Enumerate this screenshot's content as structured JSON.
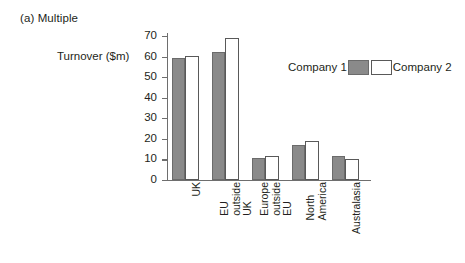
{
  "chart_data": {
    "type": "bar",
    "title": "(a) Multiple",
    "xlabel": "",
    "ylabel": "Turnover ($m)",
    "ylim": [
      0,
      70
    ],
    "yticks": [
      0,
      10,
      20,
      30,
      40,
      50,
      60,
      70
    ],
    "grid": false,
    "legend_position": "inside-upper-right",
    "categories": [
      "UK",
      "EU outside UK",
      "Europe outside EU",
      "North America",
      "Australasia"
    ],
    "category_lines": [
      [
        "UK"
      ],
      [
        "EU",
        "outside",
        "UK"
      ],
      [
        "Europe",
        "outside",
        "EU"
      ],
      [
        "North",
        "America"
      ],
      [
        "Australasia"
      ]
    ],
    "series": [
      {
        "name": "Company 1",
        "color": "#8a8a8a",
        "values": [
          59.5,
          62,
          10.5,
          17,
          11.5
        ]
      },
      {
        "name": "Company 2",
        "color": "#ffffff",
        "values": [
          60.5,
          69,
          11.5,
          19,
          10
        ]
      }
    ]
  },
  "figure": {
    "title": "(a) Multiple",
    "y_axis_title": "Turnover ($m)"
  },
  "legend": {
    "entries": [
      {
        "label": "Company 1",
        "swatch": "gray-filled-swatch"
      },
      {
        "label": "Company 2",
        "swatch": "white-outline-swatch"
      }
    ]
  }
}
